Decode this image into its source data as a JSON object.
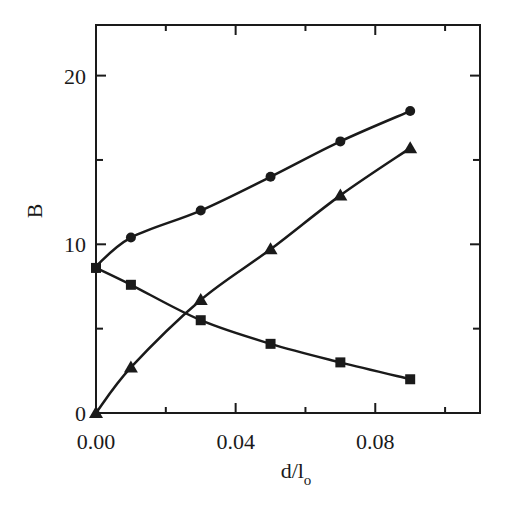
{
  "chart_data": {
    "type": "line",
    "title": "",
    "xlabel": "d/l",
    "xlabel_subscript": "o",
    "ylabel": "B",
    "xlim": [
      0.0,
      0.11
    ],
    "ylim": [
      0,
      23
    ],
    "xticks_major": [
      0.0,
      0.04,
      0.08
    ],
    "xticks_minor": [
      0.02,
      0.06,
      0.1
    ],
    "xtick_labels": [
      "0.00",
      "0.04",
      "0.08"
    ],
    "yticks_major": [
      0,
      10,
      20
    ],
    "yticks_minor": [
      5,
      15
    ],
    "ytick_labels": [
      "0",
      "10",
      "20"
    ],
    "grid": false,
    "legend": null,
    "series": [
      {
        "name": "circles",
        "marker": "circle",
        "x": [
          0.0,
          0.01,
          0.03,
          0.05,
          0.07,
          0.09
        ],
        "values": [
          8.6,
          10.4,
          12.0,
          14.0,
          16.1,
          17.9
        ],
        "fit_start": 8.7
      },
      {
        "name": "triangles",
        "marker": "triangle",
        "x": [
          0.0,
          0.01,
          0.03,
          0.05,
          0.07,
          0.09
        ],
        "values": [
          0.0,
          2.7,
          6.7,
          9.7,
          12.9,
          15.7
        ]
      },
      {
        "name": "squares",
        "marker": "square",
        "x": [
          0.0,
          0.01,
          0.03,
          0.05,
          0.07,
          0.09
        ],
        "values": [
          8.6,
          7.6,
          5.5,
          4.1,
          3.0,
          2.0
        ]
      }
    ],
    "colors": {
      "ink": "#1a1a1a",
      "background": "#ffffff"
    }
  }
}
